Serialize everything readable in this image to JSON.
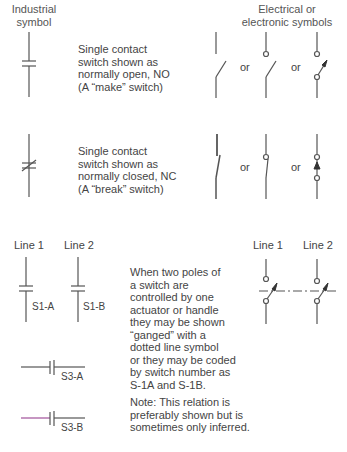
{
  "headers": {
    "industrial": [
      "Industrial",
      "symbol"
    ],
    "electrical": [
      "Electrical or",
      "electronic symbols"
    ]
  },
  "rows": [
    {
      "id": "normally-open",
      "description": [
        "Single contact",
        "switch shown as",
        "normally open, NO",
        "(A “make” switch)"
      ],
      "or_labels": [
        "or",
        "or"
      ]
    },
    {
      "id": "normally-closed",
      "description": [
        "Single contact",
        "switch shown as",
        "normally closed, NC",
        "(A “break” switch)"
      ],
      "or_labels": [
        "or",
        "or"
      ]
    }
  ],
  "ganged": {
    "line_labels_left": [
      "Line 1",
      "Line 2"
    ],
    "line_labels_right": [
      "Line 1",
      "Line 2"
    ],
    "switch_labels": [
      "S1-A",
      "S1-B",
      "S3-A",
      "S3-B"
    ],
    "description": [
      "When two poles of",
      "a switch are",
      "controlled by one",
      "actuator or handle",
      "they may be shown",
      "“ganged” with a",
      "dotted line symbol",
      "or they may be coded",
      "by switch number as",
      "S-1A and S-1B."
    ],
    "note": [
      "Note: This relation is",
      "preferably shown but is",
      "sometimes only inferred."
    ]
  },
  "colors": {
    "line": "#555555",
    "text": "#444444",
    "accent_line": "#a0509a",
    "caption_red": "#d06060"
  }
}
